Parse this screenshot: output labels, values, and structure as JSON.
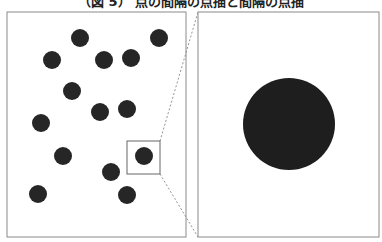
{
  "title": "（図 5） 点の間隔の点描と間隔の点描",
  "left_panel": {
    "x": 7,
    "y": 12,
    "width": 179,
    "height": 225,
    "dot_radius": 9,
    "dot_color": "#262626",
    "dots": [
      {
        "cx": 80,
        "cy": 38
      },
      {
        "cx": 159,
        "cy": 38
      },
      {
        "cx": 52,
        "cy": 60
      },
      {
        "cx": 104,
        "cy": 60
      },
      {
        "cx": 131,
        "cy": 58
      },
      {
        "cx": 72,
        "cy": 91
      },
      {
        "cx": 100,
        "cy": 112
      },
      {
        "cx": 127,
        "cy": 109
      },
      {
        "cx": 41,
        "cy": 123
      },
      {
        "cx": 63,
        "cy": 156
      },
      {
        "cx": 144,
        "cy": 156
      },
      {
        "cx": 111,
        "cy": 172
      },
      {
        "cx": 38,
        "cy": 194
      },
      {
        "cx": 127,
        "cy": 195
      }
    ],
    "zoom_box": {
      "x": 127,
      "y": 141,
      "width": 33,
      "height": 33
    }
  },
  "right_panel": {
    "x": 198,
    "y": 12,
    "width": 181,
    "height": 225,
    "circle": {
      "cx": 289,
      "cy": 124,
      "r": 46,
      "color": "#1e1e1e"
    }
  },
  "border_color": "#8a8a8a"
}
